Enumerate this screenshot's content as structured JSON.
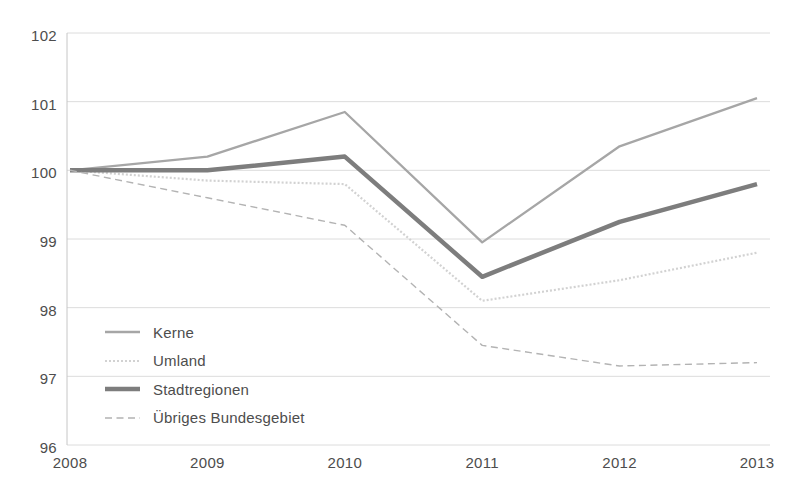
{
  "colors": {
    "background": "#ffffff",
    "text": "#4d4d4d",
    "gridline": "#dcdcdc",
    "axis_line": "#c6c6c6"
  },
  "chart_data": {
    "type": "line",
    "title": "",
    "xlabel": "",
    "ylabel": "",
    "x_labels": [
      "2008",
      "2009",
      "2010",
      "2011",
      "2012",
      "2013"
    ],
    "y_ticks": [
      96,
      97,
      98,
      99,
      100,
      101,
      102
    ],
    "ylim": [
      96,
      102
    ],
    "grid": "horizontal gridlines at every integer, light gray",
    "legend_position": "inside bottom-left",
    "series": [
      {
        "name": "Kerne",
        "slug": "kerne",
        "values": [
          100.0,
          100.2,
          100.85,
          98.95,
          100.35,
          101.05
        ],
        "color": "#a6a6a6",
        "width": 2.3,
        "dash": ""
      },
      {
        "name": "Umland",
        "slug": "umland",
        "values": [
          100.0,
          99.85,
          99.8,
          98.1,
          98.4,
          98.8
        ],
        "color": "#d2d2d2",
        "width": 2.2,
        "dash": "2 2"
      },
      {
        "name": "Stadtregionen",
        "slug": "stadtregionen",
        "values": [
          100.0,
          100.0,
          100.2,
          98.45,
          99.25,
          99.8
        ],
        "color": "#7d7d7d",
        "width": 4.5,
        "dash": ""
      },
      {
        "name": "Übriges Bundesgebiet",
        "slug": "uebriges-bundesgebiet",
        "values": [
          100.0,
          99.6,
          99.2,
          97.45,
          97.15,
          97.2
        ],
        "color": "#b3b3b3",
        "width": 1.4,
        "dash": "7 4.5"
      }
    ]
  }
}
